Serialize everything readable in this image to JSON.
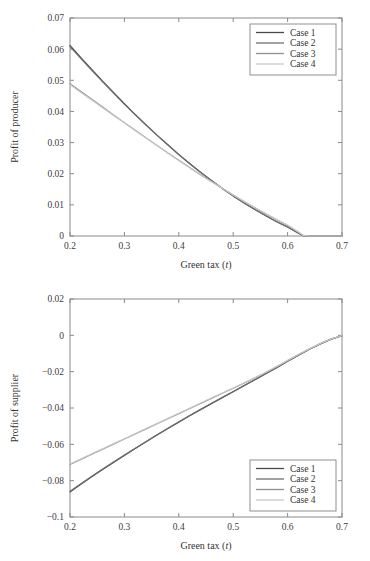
{
  "figure": {
    "background": "#ffffff",
    "axis_color": "#8a8a8a",
    "text_color": "#333333"
  },
  "series_colors": [
    "#4a4a4a",
    "#6e6e6e",
    "#8f8f8f",
    "#c9c9c9"
  ],
  "chart_data": [
    {
      "type": "line",
      "title": "",
      "xlabel_text": "Green tax (",
      "xlabel_ital": "t",
      "xlabel_tail": ")",
      "ylabel": "Profit of producer",
      "xlim": [
        0.2,
        0.7
      ],
      "ylim": [
        0,
        0.07
      ],
      "xticks": [
        0.2,
        0.3,
        0.4,
        0.5,
        0.6,
        0.7
      ],
      "xticklabels": [
        "0.2",
        "0.3",
        "0.4",
        "0.5",
        "0.6",
        "0.7"
      ],
      "yticks": [
        0,
        0.01,
        0.02,
        0.03,
        0.04,
        0.05,
        0.06,
        0.07
      ],
      "yticklabels": [
        "0",
        "0.01",
        "0.02",
        "0.03",
        "0.04",
        "0.05",
        "0.06",
        "0.07"
      ],
      "grid": false,
      "legend_position": "upper right",
      "legend_entries": [
        "Case 1",
        "Case 2",
        "Case 3",
        "Case 4"
      ],
      "x": [
        0.2,
        0.22,
        0.24,
        0.26,
        0.28,
        0.3,
        0.32,
        0.34,
        0.36,
        0.38,
        0.4,
        0.42,
        0.44,
        0.46,
        0.48,
        0.5,
        0.52,
        0.54,
        0.56,
        0.58,
        0.6,
        0.62,
        0.63,
        0.64,
        0.66,
        0.68,
        0.7
      ],
      "series": [
        {
          "name": "Case 1",
          "values": [
            0.0612,
            0.0573,
            0.0535,
            0.0497,
            0.0461,
            0.0425,
            0.039,
            0.0357,
            0.0324,
            0.0293,
            0.0262,
            0.0233,
            0.0205,
            0.0178,
            0.0153,
            0.0129,
            0.0106,
            0.0085,
            0.0065,
            0.0046,
            0.0029,
            0.0009,
            0.0,
            0.0,
            0.0,
            0.0,
            0.0
          ]
        },
        {
          "name": "Case 2",
          "values": [
            0.0608,
            0.057,
            0.0532,
            0.0495,
            0.0459,
            0.0423,
            0.0389,
            0.0355,
            0.0323,
            0.0292,
            0.0261,
            0.0232,
            0.0204,
            0.0178,
            0.0152,
            0.0128,
            0.0106,
            0.0085,
            0.0065,
            0.0046,
            0.0029,
            0.0009,
            0.0,
            0.0,
            0.0,
            0.0,
            0.0
          ]
        },
        {
          "name": "Case 3",
          "values": [
            0.0489,
            0.0464,
            0.0439,
            0.0414,
            0.0389,
            0.0364,
            0.034,
            0.0315,
            0.0291,
            0.0267,
            0.0243,
            0.022,
            0.0197,
            0.0175,
            0.0153,
            0.0132,
            0.0111,
            0.0091,
            0.0071,
            0.0052,
            0.0034,
            0.0012,
            0.0,
            0.0,
            0.0,
            0.0,
            0.0
          ]
        },
        {
          "name": "Case 4",
          "values": [
            0.0486,
            0.0461,
            0.0437,
            0.0412,
            0.0387,
            0.0363,
            0.0338,
            0.0314,
            0.029,
            0.0266,
            0.0242,
            0.0219,
            0.0196,
            0.0174,
            0.0153,
            0.0132,
            0.0111,
            0.0091,
            0.0072,
            0.0053,
            0.0035,
            0.0013,
            0.0001,
            0.0,
            0.0,
            0.0,
            0.0
          ]
        }
      ]
    },
    {
      "type": "line",
      "title": "",
      "xlabel_text": "Green tax (",
      "xlabel_ital": "t",
      "xlabel_tail": ")",
      "ylabel": "Profit of supplier",
      "xlim": [
        0.2,
        0.7
      ],
      "ylim": [
        -0.1,
        0.02
      ],
      "xticks": [
        0.2,
        0.3,
        0.4,
        0.5,
        0.6,
        0.7
      ],
      "xticklabels": [
        "0.2",
        "0.3",
        "0.4",
        "0.5",
        "0.6",
        "0.7"
      ],
      "yticks": [
        -0.1,
        -0.08,
        -0.06,
        -0.04,
        -0.02,
        0,
        0.02
      ],
      "yticklabels": [
        "−0.1",
        "−0.08",
        "−0.06",
        "−0.04",
        "−0.02",
        "0",
        "0.02"
      ],
      "grid": false,
      "legend_position": "lower right",
      "legend_entries": [
        "Case 1",
        "Case 2",
        "Case 3",
        "Case 4"
      ],
      "x": [
        0.2,
        0.22,
        0.24,
        0.26,
        0.28,
        0.3,
        0.32,
        0.34,
        0.36,
        0.38,
        0.4,
        0.42,
        0.44,
        0.46,
        0.48,
        0.5,
        0.52,
        0.54,
        0.56,
        0.58,
        0.6,
        0.62,
        0.64,
        0.66,
        0.68,
        0.7
      ],
      "series": [
        {
          "name": "Case 1",
          "values": [
            -0.0862,
            -0.082,
            -0.0779,
            -0.0739,
            -0.07,
            -0.0661,
            -0.0623,
            -0.0586,
            -0.0549,
            -0.0513,
            -0.0478,
            -0.0443,
            -0.0409,
            -0.0376,
            -0.0343,
            -0.0311,
            -0.0277,
            -0.0244,
            -0.0211,
            -0.0178,
            -0.0143,
            -0.011,
            -0.0077,
            -0.0047,
            -0.0021,
            -0.0002
          ]
        },
        {
          "name": "Case 2",
          "values": [
            -0.0858,
            -0.0817,
            -0.0776,
            -0.0736,
            -0.0697,
            -0.0659,
            -0.0621,
            -0.0584,
            -0.0547,
            -0.0511,
            -0.0476,
            -0.0441,
            -0.0407,
            -0.0374,
            -0.0341,
            -0.0309,
            -0.0276,
            -0.0243,
            -0.021,
            -0.0177,
            -0.0143,
            -0.011,
            -0.0077,
            -0.0047,
            -0.0021,
            -0.0002
          ]
        },
        {
          "name": "Case 3",
          "values": [
            -0.0711,
            -0.0683,
            -0.0655,
            -0.0627,
            -0.0599,
            -0.0571,
            -0.0543,
            -0.0515,
            -0.0487,
            -0.0459,
            -0.0431,
            -0.0403,
            -0.0375,
            -0.0347,
            -0.0319,
            -0.0291,
            -0.0263,
            -0.0234,
            -0.0204,
            -0.0172,
            -0.0139,
            -0.0106,
            -0.0075,
            -0.0046,
            -0.0021,
            -0.0002
          ]
        },
        {
          "name": "Case 4",
          "values": [
            -0.0708,
            -0.068,
            -0.0652,
            -0.0624,
            -0.0596,
            -0.0569,
            -0.0541,
            -0.0513,
            -0.0485,
            -0.0457,
            -0.0429,
            -0.0401,
            -0.0373,
            -0.0345,
            -0.0318,
            -0.029,
            -0.0262,
            -0.0233,
            -0.0203,
            -0.0171,
            -0.0138,
            -0.0105,
            -0.0074,
            -0.0045,
            -0.002,
            -0.0001
          ]
        }
      ]
    }
  ]
}
